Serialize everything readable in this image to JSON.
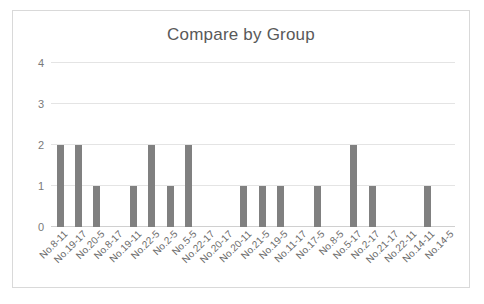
{
  "chart_data": {
    "type": "bar",
    "title": "Compare by Group",
    "xlabel": "",
    "ylabel": "",
    "ylim": [
      0,
      4
    ],
    "yticks": [
      0,
      1,
      2,
      3,
      4
    ],
    "grid": true,
    "legend": "none",
    "bar_color": "#808080",
    "categories": [
      "No.8-11",
      "No.19-17",
      "No.20-5",
      "No.8-17",
      "No.19-11",
      "No.22-5",
      "No.2-5",
      "No.5-5",
      "No.22-17",
      "No.20-17",
      "No.20-11",
      "No.21-5",
      "No.19-5",
      "No.11-17",
      "No.17-5",
      "No.8-5",
      "No.5-17",
      "No.2-17",
      "No.21-17",
      "No.22-11",
      "No.14-11",
      "No.14-5"
    ],
    "values": [
      2,
      2,
      1,
      0,
      1,
      2,
      1,
      2,
      0,
      0,
      1,
      1,
      1,
      0,
      1,
      0,
      2,
      1,
      0,
      0,
      1,
      0
    ]
  }
}
